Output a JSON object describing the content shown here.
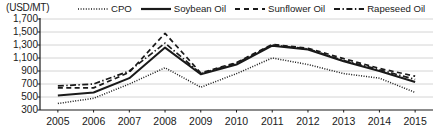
{
  "chart_data": {
    "type": "line",
    "title": "",
    "subtitle": "",
    "unit_label": "(USD/MT)",
    "xlabel": "",
    "ylabel": "USD/MT",
    "grid": true,
    "legend_position": "top",
    "x": [
      2005,
      2006,
      2007,
      2008,
      2009,
      2010,
      2011,
      2012,
      2013,
      2014,
      2015
    ],
    "categories": [
      "2005",
      "2006",
      "2007",
      "2008",
      "2009",
      "2010",
      "2011",
      "2012",
      "2013",
      "2014",
      "2015"
    ],
    "ylim": [
      300,
      1700
    ],
    "yticks": [
      300,
      500,
      700,
      900,
      1100,
      1300,
      1500,
      1700
    ],
    "ytick_labels": [
      "300",
      "500",
      "700",
      "900",
      "1,100",
      "1,300",
      "1,500",
      "1,700"
    ],
    "series": [
      {
        "name": "CPO",
        "style": "dotted",
        "color": "#1a1a1a",
        "values": [
          400,
          480,
          700,
          950,
          650,
          860,
          1100,
          1000,
          860,
          790,
          570
        ]
      },
      {
        "name": "Soybean Oil",
        "style": "solid",
        "color": "#1a1a1a",
        "values": [
          525,
          570,
          790,
          1260,
          850,
          1000,
          1290,
          1230,
          1050,
          900,
          730
        ]
      },
      {
        "name": "Sunflower Oil",
        "style": "dashed",
        "color": "#1a1a1a",
        "values": [
          640,
          640,
          880,
          1480,
          870,
          1030,
          1310,
          1250,
          1090,
          940,
          820
        ]
      },
      {
        "name": "Rapeseed Oil",
        "style": "dashdot",
        "color": "#1a1a1a",
        "values": [
          670,
          700,
          900,
          1330,
          860,
          1020,
          1300,
          1240,
          1060,
          920,
          770
        ]
      }
    ]
  },
  "legend": {
    "items": [
      {
        "label": "CPO",
        "style": "dotted"
      },
      {
        "label": "Soybean Oil",
        "style": "solid"
      },
      {
        "label": "Sunflower Oil",
        "style": "dashed"
      },
      {
        "label": "Rapeseed Oil",
        "style": "dashdot"
      }
    ]
  },
  "axis": {
    "unit_label": "(USD/MT)"
  }
}
